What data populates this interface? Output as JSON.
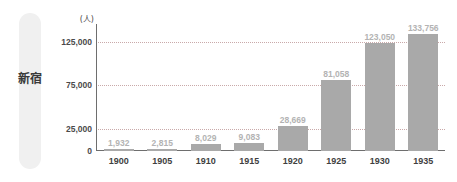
{
  "region": {
    "label": "新宿",
    "pill_color": "#f0f0f0"
  },
  "chart_data": {
    "type": "bar",
    "title": "",
    "subtitle": "",
    "xlabel": "",
    "ylabel": "",
    "unit_label": "(人)",
    "categories": [
      "1900",
      "1905",
      "1910",
      "1915",
      "1920",
      "1925",
      "1930",
      "1935"
    ],
    "values": [
      1932,
      2815,
      8029,
      9083,
      28669,
      81058,
      123050,
      133756
    ],
    "value_labels": [
      "1,932",
      "2,815",
      "8,029",
      "9,083",
      "28,669",
      "81,058",
      "123,050",
      "133,756"
    ],
    "ylim": [
      0,
      145000
    ],
    "yticks": [
      0,
      25000,
      75000,
      125000
    ],
    "ytick_labels": [
      "0",
      "25,000",
      "75,000",
      "125,000"
    ],
    "gridlines": [
      25000,
      75000,
      125000
    ],
    "grid": true,
    "legend": "none",
    "bar_color": "#a9a9a9",
    "value_label_color": "#b3b3b3",
    "axis_color": "#6e6e6e",
    "grid_color": "#c9a9a9"
  }
}
